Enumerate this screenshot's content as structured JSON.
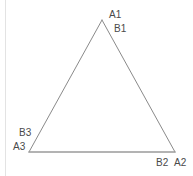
{
  "figure": {
    "kind": "triangle-diagram",
    "background_color": "#ffffff",
    "stroke_color": "#8a8a8a",
    "base_stroke_color": "#9a9a9a",
    "border_rule_color": "#e3e3e3",
    "label_color": "#4a4a4a",
    "vertices": [
      {
        "id": "apex",
        "x": 102,
        "y": 20,
        "labels": [
          "A1",
          "B1"
        ]
      },
      {
        "id": "bottom-right",
        "x": 175,
        "y": 152,
        "labels": [
          "B2",
          "A2"
        ]
      },
      {
        "id": "bottom-left",
        "x": 29,
        "y": 152,
        "labels": [
          "B3",
          "A3"
        ]
      }
    ],
    "labels": {
      "a1": "A1",
      "b1": "B1",
      "b2": "B2",
      "a2": "A2",
      "b3": "B3",
      "a3": "A3"
    }
  }
}
